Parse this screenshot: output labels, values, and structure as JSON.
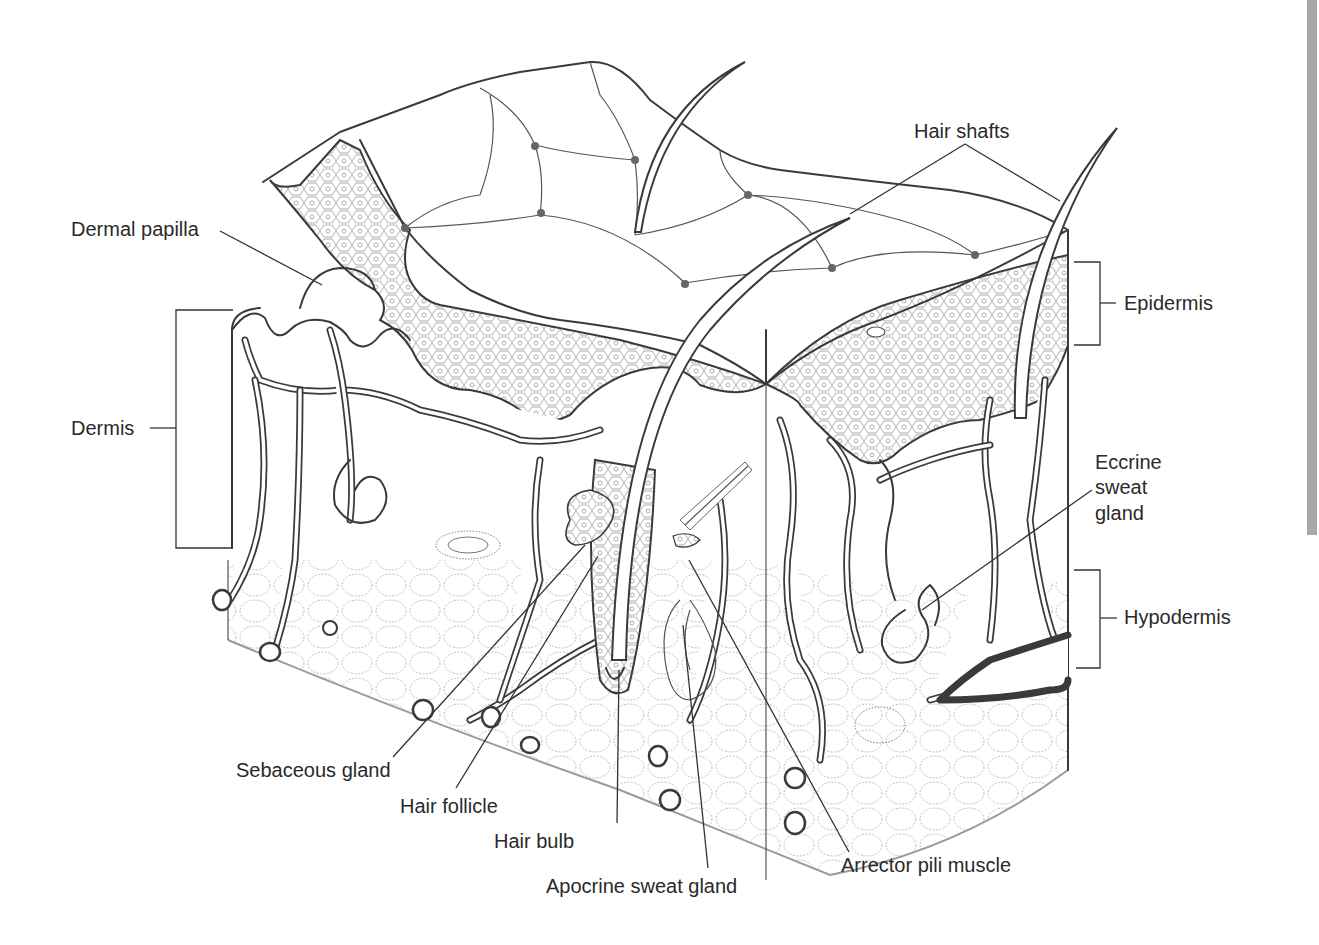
{
  "figure": {
    "type": "anatomical cross-section"
  },
  "labels": {
    "hair_shafts": "Hair shafts",
    "dermal_papilla": "Dermal papilla",
    "epidermis": "Epidermis",
    "dermis": "Dermis",
    "eccrine_line1": "Eccrine",
    "eccrine_line2": "sweat",
    "eccrine_line3": "gland",
    "hypodermis": "Hypodermis",
    "sebaceous_gland": "Sebaceous gland",
    "hair_follicle": "Hair follicle",
    "hair_bulb": "Hair bulb",
    "apocrine_sweat_gland": "Apocrine sweat gland",
    "arrector_pili_muscle": "Arrector pili muscle"
  },
  "colors": {
    "ink": "#3a3a3a",
    "background": "#ffffff",
    "side_bar": "#a9a9a9"
  }
}
